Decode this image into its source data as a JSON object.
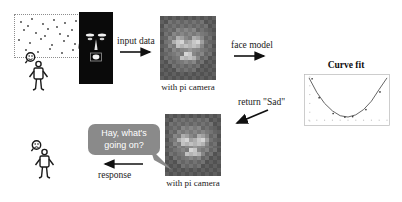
{
  "diagram": {
    "background": "#ffffff",
    "nodes": {
      "point_cloud": {
        "name": "dotted-point-cloud-bubble",
        "description": "dotted-outline thought bubble containing scattered dots"
      },
      "face_panel": {
        "name": "black-face-capture-panel",
        "description": "black panel with light face (eyes, nose, mouth)"
      },
      "pixel_face_top": {
        "name": "pixelated-face-grid-top",
        "caption": "with pi camera"
      },
      "pixel_face_bottom": {
        "name": "pixelated-face-grid-bottom",
        "caption": "with pi camera"
      },
      "person_top": {
        "name": "stick-figure-person-top",
        "mood": "neutral"
      },
      "person_bottom": {
        "name": "stick-figure-person-bottom",
        "mood": "sad"
      }
    },
    "arrows": [
      {
        "id": "input-data",
        "label": "input data",
        "direction": "right"
      },
      {
        "id": "face-model",
        "label": "face model",
        "direction": "right"
      },
      {
        "id": "return-sad",
        "label": "return \"Sad\"",
        "direction": "left-down"
      },
      {
        "id": "response",
        "label": "response",
        "direction": "left"
      }
    ],
    "speech": {
      "name": "speech-bubble",
      "text": "Hay, what's\ngoing on?",
      "bubble_color": "#8a8a8a",
      "text_color": "#ffffff"
    }
  },
  "chart_data": {
    "type": "scatter",
    "title": "Curve fit",
    "xlabel": "",
    "ylabel": "",
    "xlim": [
      0,
      10
    ],
    "ylim": [
      0,
      10
    ],
    "grid": false,
    "legend": "none",
    "x": [
      0.4,
      1.3,
      3.1,
      4.6,
      5.6,
      7.3,
      9.1
    ],
    "values": [
      9.6,
      5.3,
      1.7,
      0.9,
      1.0,
      2.6,
      6.6
    ],
    "series": [
      {
        "name": "data points",
        "x": [
          0.4,
          1.3,
          3.1,
          4.6,
          5.6,
          7.3,
          9.1
        ],
        "values": [
          9.6,
          5.3,
          1.7,
          0.9,
          1.0,
          2.6,
          6.6
        ]
      },
      {
        "name": "fitted curve",
        "type": "line",
        "shape": "parabola",
        "x": [
          0.0,
          1.0,
          2.0,
          3.0,
          4.0,
          5.0,
          6.0,
          7.0,
          8.0,
          9.0,
          10.0
        ],
        "values": [
          9.8,
          6.5,
          4.0,
          2.3,
          1.2,
          0.9,
          1.4,
          2.6,
          4.5,
          7.2,
          9.8
        ]
      }
    ],
    "xticks": [
      "0",
      "1",
      "2",
      "3",
      "4",
      "5",
      "6",
      "7",
      "8",
      "9",
      "10"
    ],
    "yticks": [
      "0",
      "2",
      "4",
      "6",
      "8",
      "10"
    ]
  }
}
